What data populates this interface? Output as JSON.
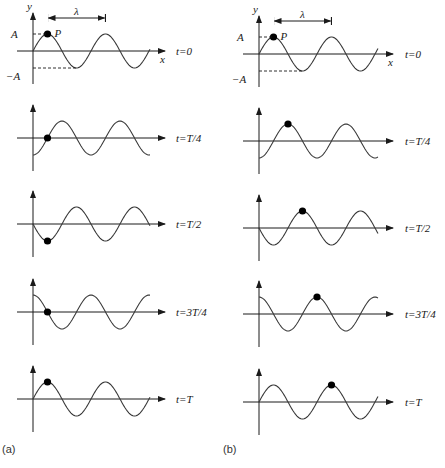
{
  "figure": {
    "wave": {
      "wavelength_label": "λ",
      "amplitude_label": "A",
      "neg_amplitude_label": "−A",
      "y_axis_label": "y",
      "x_axis_label": "x",
      "point_label": "P",
      "direction": "+x",
      "colors": {
        "line": "#3a3a3a",
        "axis": "#1a1a1a",
        "dot": "#000000"
      }
    },
    "time_labels": [
      "t=0",
      "t=T/4",
      "t=T/2",
      "t=3T/4",
      "t=T"
    ],
    "panels": [
      {
        "id": "a",
        "label": "(a)",
        "meaning": "Marked particle P at a fixed position oscillates vertically",
        "dot_phase_quarters": [
          0,
          0,
          0,
          0,
          0
        ],
        "dot_y_state": [
          "+A",
          "0",
          "-A",
          "0",
          "+A"
        ]
      },
      {
        "id": "b",
        "label": "(b)",
        "meaning": "Marked crest travels forward λ/4 each quarter period",
        "dot_phase_quarters": [
          0,
          1,
          2,
          3,
          4
        ],
        "dot_y_state": [
          "+A",
          "+A",
          "+A",
          "+A",
          "+A"
        ]
      }
    ]
  }
}
